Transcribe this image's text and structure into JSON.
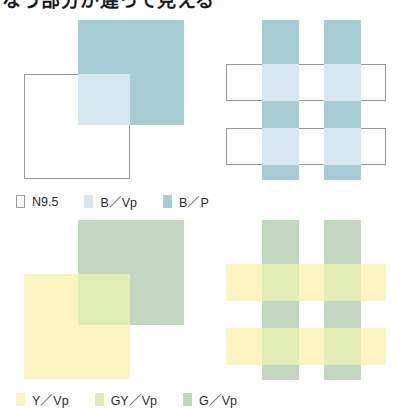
{
  "heading": {
    "text": "なう部分が違って見える",
    "note": "top line cropped by image edge"
  },
  "colors": {
    "white_n95": "#ffffff",
    "outline": "#9a9a9a",
    "b_vp": "#d6e8ef",
    "b_p": "#a8ccd4",
    "y_vp": "#faf4c0",
    "gy_vp": "#e2ecb5",
    "g_vp": "#c3d6c0",
    "page_background": "#ffffff",
    "text": "#2b2b2b"
  },
  "panels": {
    "top_left": {
      "name": "blue-overlapping-squares",
      "back_square_color": "#a8ccd4",
      "front_square_color": "#ffffff",
      "front_square_outlined": true,
      "overlap_color": "#d6e8ef"
    },
    "top_right": {
      "name": "blue-plaid-weave",
      "vertical_stripe_color": "#a8ccd4",
      "horizontal_band_color": "#ffffff",
      "horizontal_band_outlined": true,
      "intersection_color": "#d6e8ef",
      "vertical_stripe_count": 2,
      "horizontal_band_count": 2
    },
    "bottom_left": {
      "name": "yellow-green-overlapping-squares",
      "back_square_color": "#c3d6c0",
      "front_square_color": "#faf4c0",
      "front_square_outlined": false,
      "overlap_color": "#e2ecb5"
    },
    "bottom_right": {
      "name": "yellow-green-plaid-weave",
      "vertical_stripe_color": "#c3d6c0",
      "horizontal_band_color": "#faf4c0",
      "horizontal_band_outlined": false,
      "intersection_color": "#e2ecb5",
      "vertical_stripe_count": 2,
      "horizontal_band_count": 2
    }
  },
  "legend_top": {
    "items": [
      {
        "label": "N9.5",
        "color": "#ffffff",
        "outlined": true
      },
      {
        "label": "B／Vp",
        "color": "#d6e8ef",
        "outlined": false
      },
      {
        "label": "B／P",
        "color": "#a8ccd4",
        "outlined": false
      }
    ]
  },
  "legend_bottom": {
    "items": [
      {
        "label": "Y／Vp",
        "color": "#faf4c0",
        "outlined": false
      },
      {
        "label": "GY／Vp",
        "color": "#e2ecb5",
        "outlined": false
      },
      {
        "label": "G／Vp",
        "color": "#c3d6c0",
        "outlined": false
      }
    ]
  }
}
